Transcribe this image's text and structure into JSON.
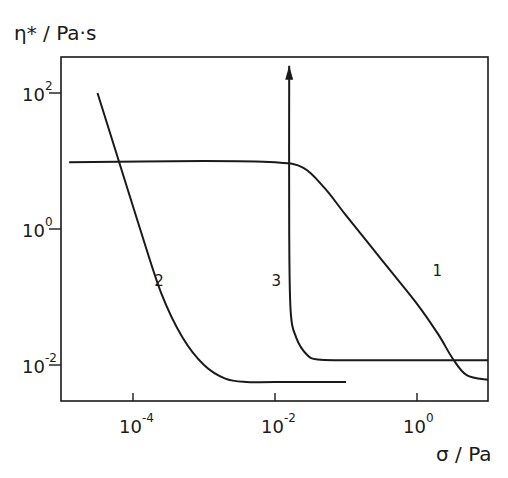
{
  "chart_data": {
    "type": "line",
    "title": "",
    "xlabel": "σ / Pa",
    "ylabel": "η* / Pa·s",
    "xscale": "log",
    "yscale": "log",
    "xlim_log10": [
      -5.0,
      1.0
    ],
    "ylim_log10": [
      -2.5,
      2.4
    ],
    "grid": false,
    "legend": "none (curves labeled inline 1, 2, 3)",
    "x_ticks": [
      {
        "log": -4,
        "label_base": "10",
        "label_exp": "-4"
      },
      {
        "log": -2,
        "label_base": "10",
        "label_exp": "-2"
      },
      {
        "log": 0,
        "label_base": "10",
        "label_exp": "0"
      }
    ],
    "y_ticks": [
      {
        "log": 2,
        "label_base": "10",
        "label_exp": "2"
      },
      {
        "log": 0,
        "label_base": "10",
        "label_exp": "0"
      },
      {
        "log": -2,
        "label_base": "10",
        "label_exp": "-2"
      }
    ],
    "series": [
      {
        "name": "1",
        "description": "Newtonian plateau then shear thinning",
        "log_sigma": [
          -4.9,
          -3.0,
          -2.0,
          -1.6,
          -1.3,
          -1.0,
          -0.5,
          0.0,
          0.3,
          0.5,
          0.7,
          1.0
        ],
        "log_eta": [
          0.98,
          1.0,
          0.98,
          0.9,
          0.6,
          0.2,
          -0.45,
          -1.1,
          -1.55,
          -1.9,
          -2.15,
          -2.22
        ]
      },
      {
        "name": "2",
        "description": "Steep decline to low plateau",
        "log_sigma": [
          -4.5,
          -4.2,
          -3.9,
          -3.6,
          -3.3,
          -3.0,
          -2.7,
          -2.4,
          -2.0,
          -1.0
        ],
        "log_eta": [
          2.0,
          1.0,
          0.0,
          -0.95,
          -1.6,
          -2.0,
          -2.2,
          -2.25,
          -2.25,
          -2.25
        ]
      },
      {
        "name": "3",
        "description": "Yield stress (vertical) then low plateau",
        "log_sigma": [
          -1.8,
          -1.8,
          -1.78,
          -1.7,
          -1.55,
          -1.4,
          -1.0,
          0.0,
          1.0
        ],
        "log_eta": [
          2.4,
          0.0,
          -1.2,
          -1.6,
          -1.85,
          -1.92,
          -1.93,
          -1.93,
          -1.93
        ],
        "arrow_up": true
      }
    ],
    "inline_labels": [
      {
        "text": "1",
        "log_sigma": 0.22,
        "log_eta": -0.6
      },
      {
        "text": "2",
        "log_sigma": -3.7,
        "log_eta": -0.75
      },
      {
        "text": "3",
        "log_sigma": -2.05,
        "log_eta": -0.75
      }
    ]
  }
}
